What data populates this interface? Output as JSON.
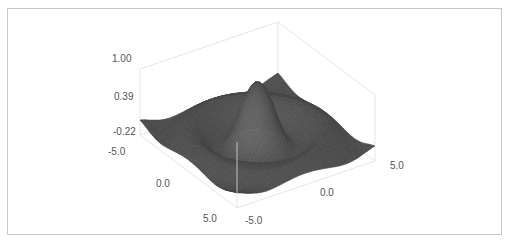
{
  "chart_data": {
    "type": "surface3d",
    "title": "",
    "function": "z = sin(r)/r, r = sqrt(x^2 + y^2)",
    "x": {
      "label": "",
      "range": [
        -5.0,
        5.0
      ],
      "ticks": [
        "-5.0",
        "0.0",
        "5.0"
      ]
    },
    "y": {
      "label": "",
      "range": [
        -5.0,
        5.0
      ],
      "ticks": [
        "-5.0",
        "0.0",
        "5.0"
      ]
    },
    "z": {
      "label": "",
      "range": [
        -0.22,
        1.0
      ],
      "ticks": [
        "-0.22",
        "0.39",
        "1.00"
      ]
    },
    "grid": false,
    "legend": null,
    "surface_color": "#4a4a4a",
    "box_color": "#dedede",
    "peak": {
      "x": 0.0,
      "y": 0.0,
      "z": 1.0
    },
    "min_value": -0.22
  },
  "labels": {
    "z_ticks": [
      "1.00",
      "0.39",
      "-0.22"
    ],
    "left_axis_ticks": [
      "-5.0",
      "0.0",
      "5.0"
    ],
    "right_axis_ticks": [
      "-5.0",
      "0.0",
      "5.0"
    ]
  }
}
